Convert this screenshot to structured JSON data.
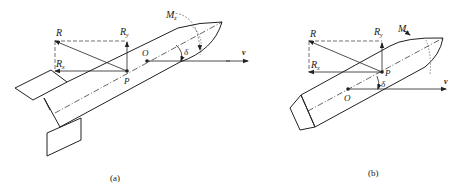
{
  "figure": {
    "panels": [
      {
        "id": "a",
        "caption": "(a)",
        "labels": {
          "R": "R",
          "Ry": "R",
          "Ry_sub": "y",
          "Rx": "R",
          "Rx_sub": "x",
          "P": "P",
          "O": "O",
          "delta": "δ",
          "Mz": "M",
          "Mz_sub": "z",
          "v": "v"
        },
        "description": "Finned rocket with pressure center P aft of center of mass O; angle of attack δ between body axis and velocity v"
      },
      {
        "id": "b",
        "caption": "(b)",
        "labels": {
          "R": "R",
          "Ry": "R",
          "Ry_sub": "y",
          "Rx": "R",
          "Rx_sub": "x",
          "P": "P",
          "O": "O",
          "delta": "δ",
          "Mz": "M",
          "Mz_sub": "z",
          "v": "v"
        },
        "description": "Finless projectile with pressure center P ahead of center of mass O; angle δ between body axis and velocity v"
      }
    ],
    "colors": {
      "stroke": "#222222",
      "background": "#ffffff"
    }
  }
}
